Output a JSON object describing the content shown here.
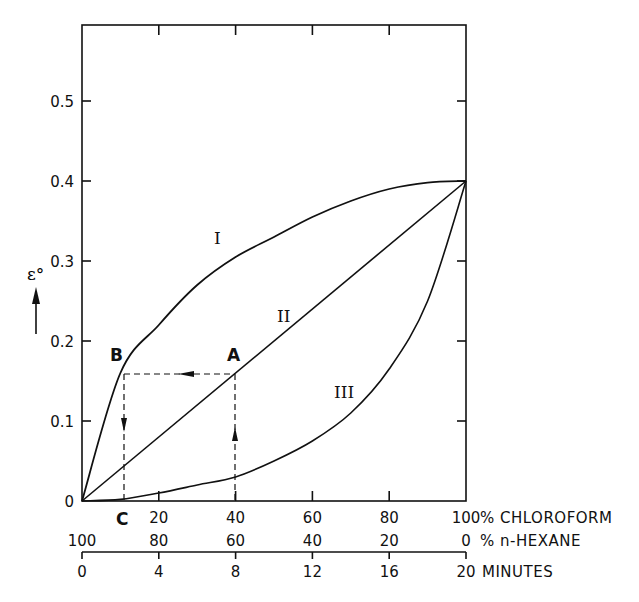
{
  "chart_data": {
    "type": "line",
    "title": "",
    "ylabel": "ε°",
    "ylim": [
      0,
      0.6
    ],
    "yticks": [
      0,
      0.1,
      0.2,
      0.3,
      0.4,
      0.5
    ],
    "ytick_labels": [
      "0",
      "0.1",
      "0.2",
      "0.3",
      "0.4",
      "0.5"
    ],
    "grid": false,
    "x_axes": [
      {
        "name": "chloroform",
        "label": "% CHLOROFORM",
        "ticks": [
          0,
          20,
          40,
          60,
          80,
          100
        ],
        "tick_labels": [
          "",
          "20",
          "40",
          "60",
          "80",
          "100"
        ]
      },
      {
        "name": "hexane",
        "label": "% n-HEXANE",
        "ticks": [
          0,
          20,
          40,
          60,
          80,
          100
        ],
        "tick_labels": [
          "100",
          "80",
          "60",
          "40",
          "20",
          "0"
        ]
      },
      {
        "name": "minutes",
        "label": "MINUTES",
        "ticks": [
          0,
          20,
          40,
          60,
          80,
          100
        ],
        "tick_labels": [
          "0",
          "4",
          "8",
          "12",
          "16",
          "20"
        ]
      }
    ],
    "x": [
      0,
      10,
      20,
      30,
      40,
      50,
      60,
      70,
      80,
      90,
      100
    ],
    "series": [
      {
        "name": "I",
        "values": [
          0,
          0.16,
          0.22,
          0.27,
          0.305,
          0.33,
          0.355,
          0.375,
          0.39,
          0.398,
          0.4
        ]
      },
      {
        "name": "II",
        "values": [
          0,
          0.04,
          0.08,
          0.12,
          0.16,
          0.2,
          0.24,
          0.28,
          0.32,
          0.36,
          0.4
        ]
      },
      {
        "name": "III",
        "values": [
          0,
          0.002,
          0.01,
          0.02,
          0.03,
          0.05,
          0.075,
          0.11,
          0.165,
          0.25,
          0.4
        ]
      }
    ],
    "annotations": [
      {
        "label": "A",
        "x": 40,
        "y": 0.16,
        "note": "point on line II"
      },
      {
        "label": "B",
        "x": 11,
        "y": 0.16,
        "note": "point on curve I at same ε° as A"
      },
      {
        "label": "C",
        "x": 11,
        "y": 0,
        "note": "projection of B onto x axis"
      }
    ],
    "series_labels": {
      "I": "I",
      "II": "II",
      "III": "III"
    }
  },
  "labels": {
    "y_axis_symbol": "ε°",
    "origin": "0",
    "point_a": "A",
    "point_b": "B",
    "point_c": "C",
    "curve_1": "I",
    "curve_2": "II",
    "curve_3": "III"
  }
}
